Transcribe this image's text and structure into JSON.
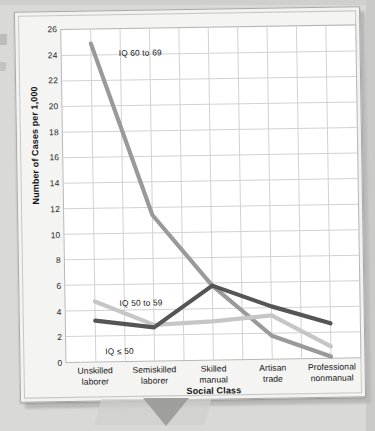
{
  "figure": {
    "y_axis_title": "Number of Cases per 1,000",
    "x_axis_title": "Social Class"
  },
  "chart_data": {
    "type": "line",
    "title": "",
    "xlabel": "Social Class",
    "ylabel": "Number of Cases per 1,000",
    "ylim": [
      0,
      26
    ],
    "ytick_step": 2,
    "yticks": [
      0,
      2,
      4,
      6,
      8,
      10,
      12,
      14,
      16,
      18,
      20,
      22,
      24,
      26
    ],
    "ytick_labels": [
      "0",
      "2",
      "4",
      "6",
      "8",
      "10",
      "12",
      "14",
      "16",
      "18",
      "20",
      "22",
      "24",
      "26"
    ],
    "grid": true,
    "grid_vertical_columns": 10,
    "legend": "inline-annotations",
    "categories": [
      "Unskilled laborer",
      "Semiskilled laborer",
      "Skilled manual",
      "Artisan trade",
      "Professional nonmanual"
    ],
    "category_lines": [
      [
        "Unskilled",
        "laborer"
      ],
      [
        "Semiskilled",
        "laborer"
      ],
      [
        "Skilled",
        "manual"
      ],
      [
        "Artisan",
        "trade"
      ],
      [
        "Professional",
        "nonmanual"
      ]
    ],
    "series": [
      {
        "name": "IQ 60 to 69",
        "color": "#9a9a9a",
        "values": [
          24.9,
          11.4,
          5.8,
          1.8,
          0.1
        ],
        "annotation_label": "IQ 60 to 69"
      },
      {
        "name": "IQ 50 to 59",
        "color": "#c6c6c6",
        "values": [
          4.7,
          2.8,
          3.0,
          3.4,
          0.9
        ],
        "annotation_label": "IQ 50 to 59"
      },
      {
        "name": "IQ ≤ 50",
        "color": "#555555",
        "values": [
          3.2,
          2.6,
          5.8,
          4.1,
          2.7
        ],
        "annotation_label": "IQ ≤ 50"
      }
    ]
  }
}
